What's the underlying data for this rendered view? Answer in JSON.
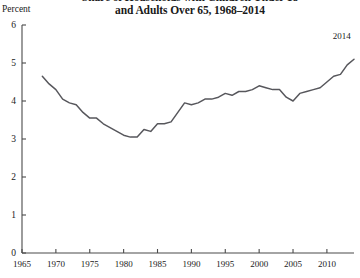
{
  "chart_data": {
    "type": "line",
    "title": "Share of Households with Children Under 18 and Adults Over 65, 1968–2014",
    "title_line1": "Share of Households with Children Under 18",
    "title_line2": "and Adults Over 65, 1968–2014",
    "xlabel": "",
    "ylabel": "Percent",
    "ylim": [
      0,
      6
    ],
    "xlim": [
      1965,
      2014
    ],
    "grid": false,
    "legend": "none",
    "line_color": "#57575c",
    "axis_color": "#4a4a4a",
    "yticks": [
      0,
      1,
      2,
      3,
      4,
      5,
      6
    ],
    "ytick_labels": [
      "0",
      "1",
      "2",
      "3",
      "4",
      "5",
      "6"
    ],
    "xticks": [
      1965,
      1970,
      1975,
      1980,
      1985,
      1990,
      1995,
      2000,
      2005,
      2010
    ],
    "xtick_labels": [
      "1965",
      "1970",
      "1975",
      "1980",
      "1985",
      "1990",
      "1995",
      "2000",
      "2005",
      "2010"
    ],
    "annotations": [
      {
        "text": "2014",
        "x": 2012.2,
        "y": 5.62
      }
    ],
    "series": [
      {
        "name": "Share of households with children under 18 and adults over 65",
        "x": [
          1968,
          1969,
          1970,
          1971,
          1972,
          1973,
          1974,
          1975,
          1976,
          1977,
          1978,
          1979,
          1980,
          1981,
          1982,
          1983,
          1984,
          1985,
          1986,
          1987,
          1988,
          1989,
          1990,
          1991,
          1992,
          1993,
          1994,
          1995,
          1996,
          1997,
          1998,
          1999,
          2000,
          2001,
          2002,
          2003,
          2004,
          2005,
          2006,
          2007,
          2008,
          2009,
          2010,
          2011,
          2012,
          2013,
          2014
        ],
        "values": [
          4.65,
          4.45,
          4.3,
          4.05,
          3.95,
          3.9,
          3.7,
          3.55,
          3.55,
          3.4,
          3.3,
          3.2,
          3.1,
          3.05,
          3.05,
          3.25,
          3.2,
          3.4,
          3.4,
          3.45,
          3.7,
          3.95,
          3.9,
          3.95,
          4.05,
          4.05,
          4.1,
          4.2,
          4.15,
          4.25,
          4.25,
          4.3,
          4.4,
          4.35,
          4.3,
          4.3,
          4.1,
          4.0,
          4.2,
          4.25,
          4.3,
          4.35,
          4.5,
          4.65,
          4.7,
          4.95,
          5.1
        ]
      }
    ]
  }
}
